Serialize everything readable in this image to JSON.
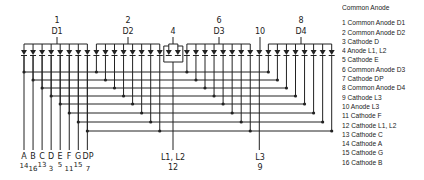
{
  "legend": {
    "title": "Common Anode",
    "pins": [
      {
        "num": "1",
        "name": "Common Anode D1"
      },
      {
        "num": "2",
        "name": "Common Anode D2"
      },
      {
        "num": "3",
        "name": "Cathode D"
      },
      {
        "num": "4",
        "name": "Anode L1, L2"
      },
      {
        "num": "5",
        "name": "Cathode E"
      },
      {
        "num": "6",
        "name": "Common Anode D3"
      },
      {
        "num": "7",
        "name": "Cathode DP"
      },
      {
        "num": "8",
        "name": "Common Anode D4"
      },
      {
        "num": "9",
        "name": "Cathode L3"
      },
      {
        "num": "10",
        "name": "Anode L3"
      },
      {
        "num": "11",
        "name": "Cathode F"
      },
      {
        "num": "12",
        "name": "Cathode L1, L2"
      },
      {
        "num": "13",
        "name": "Cathode C"
      },
      {
        "num": "14",
        "name": "Cathode A"
      },
      {
        "num": "15",
        "name": "Cathode G"
      },
      {
        "num": "16",
        "name": "Cathode B"
      }
    ]
  },
  "top_labels": [
    {
      "pin": "1",
      "digit": "D1"
    },
    {
      "pin": "2",
      "digit": "D2"
    },
    {
      "pin": "4",
      "digit": ""
    },
    {
      "pin": "6",
      "digit": "D3"
    },
    {
      "pin": "10",
      "digit": ""
    },
    {
      "pin": "8",
      "digit": "D4"
    }
  ],
  "segment_labels": [
    {
      "seg": "A",
      "pin": "14"
    },
    {
      "seg": "B",
      "pin": "16"
    },
    {
      "seg": "C",
      "pin": "13"
    },
    {
      "seg": "D",
      "pin": "3"
    },
    {
      "seg": "E",
      "pin": "5"
    },
    {
      "seg": "F",
      "pin": "11"
    },
    {
      "seg": "G",
      "pin": "15"
    },
    {
      "seg": "DP",
      "pin": "7"
    }
  ],
  "colon_label": {
    "name": "L1, L2",
    "pin": "12"
  },
  "l3_label": {
    "name": "L3",
    "pin": "9"
  }
}
